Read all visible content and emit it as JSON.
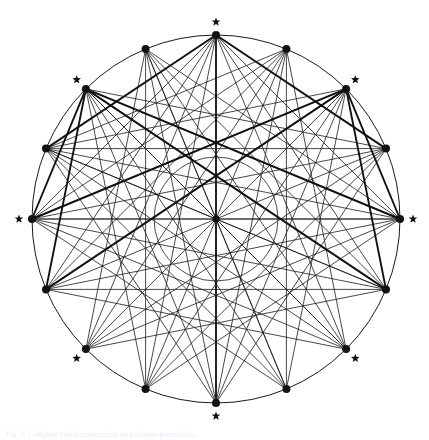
{
  "figure": {
    "type": "geometric-line-diagram",
    "caption": "Fig. 1. Complete chord construction on a sixteen-point circle.",
    "background_color": "#ffffff",
    "stroke_color": "#1a1a1a",
    "thin_stroke_width": 0.8,
    "bold_stroke_width": 1.9,
    "vertex_marker": "filled-circle-dot",
    "vertex_marker_radius": 4.0,
    "star_marker": "five-pointed-star",
    "star_glyph": "★",
    "star_size": 9
  },
  "geometry": {
    "center": {
      "x": 216,
      "y": 219
    },
    "outer_radius": 184,
    "inner_radius": 62,
    "vertex_count": 16,
    "angle_step_degrees": 22.5,
    "start_angle_degrees": -90,
    "star_vertex_indices": [
      0,
      2,
      4,
      6,
      8,
      10,
      12,
      14
    ],
    "star_offset": 13,
    "vertices": [
      {
        "index": 0,
        "label": "N",
        "angle": -90,
        "x": 216,
        "y": 35,
        "star": true
      },
      {
        "index": 1,
        "label": "NNE",
        "angle": -67.5,
        "x": 286,
        "y": 49,
        "star": false
      },
      {
        "index": 2,
        "label": "NE",
        "angle": -45,
        "x": 346,
        "y": 89,
        "star": true
      },
      {
        "index": 3,
        "label": "ENE",
        "angle": -22.5,
        "x": 386,
        "y": 149,
        "star": false
      },
      {
        "index": 4,
        "label": "E",
        "angle": 0,
        "x": 400,
        "y": 219,
        "star": true
      },
      {
        "index": 5,
        "label": "ESE",
        "angle": 22.5,
        "x": 386,
        "y": 289,
        "star": false
      },
      {
        "index": 6,
        "label": "SE",
        "angle": 45,
        "x": 346,
        "y": 349,
        "star": true
      },
      {
        "index": 7,
        "label": "SSE",
        "angle": 67.5,
        "x": 286,
        "y": 389,
        "star": false
      },
      {
        "index": 8,
        "label": "S",
        "angle": 90,
        "x": 216,
        "y": 403,
        "star": true
      },
      {
        "index": 9,
        "label": "SSW",
        "angle": 112.5,
        "x": 146,
        "y": 389,
        "star": false
      },
      {
        "index": 10,
        "label": "SW",
        "angle": 135,
        "x": 86,
        "y": 349,
        "star": true
      },
      {
        "index": 11,
        "label": "WSW",
        "angle": 157.5,
        "x": 46,
        "y": 289,
        "star": false
      },
      {
        "index": 12,
        "label": "W",
        "angle": 180,
        "x": 31,
        "y": 219,
        "star": true
      },
      {
        "index": 13,
        "label": "WNW",
        "angle": 202.5,
        "x": 46,
        "y": 149,
        "star": false
      },
      {
        "index": 14,
        "label": "NW",
        "angle": 225,
        "x": 86,
        "y": 89,
        "star": true
      },
      {
        "index": 15,
        "label": "NNW",
        "angle": 247.5,
        "x": 146,
        "y": 49,
        "star": false
      }
    ]
  },
  "chart_data": {
    "type": "scatter",
    "title": "",
    "xlabel": "",
    "ylabel": "",
    "legend": [],
    "grid": false,
    "categories": [
      "N",
      "NNE",
      "NE",
      "ENE",
      "E",
      "ESE",
      "SE",
      "SSE",
      "S",
      "SSW",
      "SW",
      "WSW",
      "W",
      "WNW",
      "NW",
      "NNW"
    ],
    "values": [
      184,
      184,
      184,
      184,
      184,
      184,
      184,
      184,
      184,
      184,
      184,
      184,
      184,
      184,
      184,
      184
    ],
    "note": "All 16 points lie on a circle of radius 184 px; radial spokes connect every point to the centre, and chord families connect each point to several non-adjacent points."
  },
  "edges": {
    "radial_spokes": [
      0,
      1,
      2,
      3,
      4,
      5,
      6,
      7,
      8,
      9,
      10,
      11,
      12,
      13,
      14,
      15
    ],
    "bold_spoke_indices": [
      0,
      8
    ],
    "bold_chord_pairs": [
      [
        14,
        4
      ],
      [
        14,
        5
      ],
      [
        14,
        12
      ],
      [
        14,
        11
      ],
      [
        2,
        12
      ],
      [
        2,
        11
      ],
      [
        2,
        4
      ],
      [
        2,
        5
      ],
      [
        0,
        13
      ],
      [
        0,
        3
      ]
    ],
    "thin_chord_pairs": [
      [
        0,
        5
      ],
      [
        0,
        11
      ],
      [
        0,
        6
      ],
      [
        0,
        10
      ],
      [
        0,
        4
      ],
      [
        0,
        12
      ],
      [
        1,
        6
      ],
      [
        1,
        11
      ],
      [
        1,
        12
      ],
      [
        1,
        8
      ],
      [
        1,
        13
      ],
      [
        2,
        7
      ],
      [
        2,
        8
      ],
      [
        2,
        13
      ],
      [
        2,
        9
      ],
      [
        3,
        8
      ],
      [
        3,
        13
      ],
      [
        3,
        9
      ],
      [
        3,
        14
      ],
      [
        3,
        10
      ],
      [
        4,
        9
      ],
      [
        4,
        10
      ],
      [
        4,
        14
      ],
      [
        4,
        11
      ],
      [
        4,
        12
      ],
      [
        5,
        10
      ],
      [
        5,
        11
      ],
      [
        5,
        15
      ],
      [
        5,
        12
      ],
      [
        5,
        13
      ],
      [
        6,
        11
      ],
      [
        6,
        12
      ],
      [
        6,
        0
      ],
      [
        6,
        13
      ],
      [
        6,
        14
      ],
      [
        7,
        12
      ],
      [
        7,
        13
      ],
      [
        7,
        1
      ],
      [
        7,
        14
      ],
      [
        7,
        15
      ],
      [
        8,
        13
      ],
      [
        8,
        14
      ],
      [
        8,
        2
      ],
      [
        8,
        15
      ],
      [
        8,
        3
      ],
      [
        9,
        14
      ],
      [
        9,
        15
      ],
      [
        9,
        3
      ],
      [
        9,
        0
      ],
      [
        9,
        4
      ],
      [
        10,
        15
      ],
      [
        10,
        0
      ],
      [
        10,
        4
      ],
      [
        10,
        1
      ],
      [
        10,
        5
      ],
      [
        11,
        0
      ],
      [
        11,
        1
      ],
      [
        11,
        5
      ],
      [
        11,
        2
      ],
      [
        11,
        6
      ],
      [
        12,
        1
      ],
      [
        12,
        2
      ],
      [
        12,
        6
      ],
      [
        12,
        3
      ],
      [
        12,
        7
      ],
      [
        13,
        2
      ],
      [
        13,
        3
      ],
      [
        13,
        7
      ],
      [
        13,
        4
      ],
      [
        13,
        8
      ],
      [
        14,
        3
      ],
      [
        14,
        4
      ],
      [
        14,
        8
      ],
      [
        14,
        9
      ],
      [
        15,
        4
      ],
      [
        15,
        5
      ],
      [
        15,
        9
      ],
      [
        15,
        6
      ],
      [
        15,
        10
      ]
    ]
  }
}
